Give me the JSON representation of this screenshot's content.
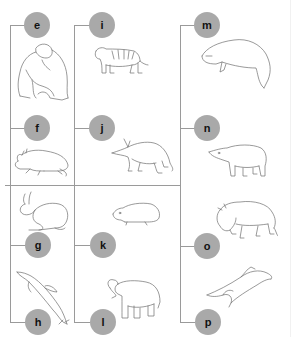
{
  "diagram": {
    "type": "cladogram-label-tree",
    "line_color": "#9a9a9a",
    "node_color": "#a9a9a9",
    "columns": [
      {
        "id": "col-1",
        "nodes": [
          {
            "label": "e",
            "animal": "chimpanzee"
          },
          {
            "label": "f",
            "animal": "rodent"
          },
          {
            "label": "g",
            "animal": "rabbit"
          },
          {
            "label": "h",
            "animal": "dolphin"
          }
        ]
      },
      {
        "id": "col-2",
        "nodes": [
          {
            "label": "i",
            "animal": "tiger"
          },
          {
            "label": "j",
            "animal": "aardvark"
          },
          {
            "label": "k",
            "animal": "hyrax"
          },
          {
            "label": "l",
            "animal": "elephant"
          }
        ]
      },
      {
        "id": "col-3",
        "nodes": [
          {
            "label": "m",
            "animal": "manatee"
          },
          {
            "label": "n",
            "animal": "tapir"
          },
          {
            "label": "o",
            "animal": "bison"
          },
          {
            "label": "p",
            "animal": "flying-lemur"
          }
        ]
      }
    ]
  }
}
